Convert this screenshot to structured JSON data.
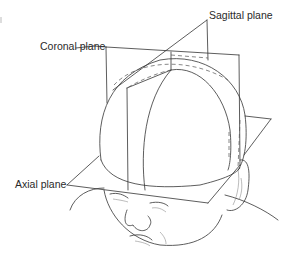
{
  "figure": {
    "labels": {
      "sagittal": "Sagittal plane",
      "coronal": "Coronal plane",
      "axial": "Axial plane"
    },
    "colors": {
      "line": "#333333",
      "text": "#2a2a2a",
      "background": "#ffffff"
    }
  }
}
